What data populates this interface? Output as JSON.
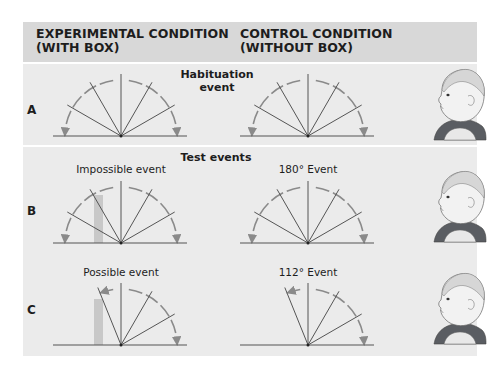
{
  "header": {
    "experimental_title": "EXPERIMENTAL CONDITION\n(WITH BOX)",
    "control_title": "CONTROL CONDITION\n(WITHOUT BOX)"
  },
  "rows": {
    "A": {
      "label": "A",
      "center_title": "Habituation\nevent"
    },
    "B": {
      "label": "B",
      "center_title": "Test events",
      "left_caption": "Impossible event",
      "right_caption": "180° Event"
    },
    "C": {
      "label": "C",
      "left_caption": "Possible event",
      "right_caption": "112° Event"
    }
  },
  "diagrams": [
    {
      "id": "A-left",
      "row": "A",
      "condition": "experimental",
      "screen_rotation_deg": 180,
      "box": false,
      "spoke_angles_deg": [
        30,
        60,
        90,
        120,
        150
      ]
    },
    {
      "id": "A-right",
      "row": "A",
      "condition": "control",
      "screen_rotation_deg": 180,
      "box": false,
      "spoke_angles_deg": [
        30,
        60,
        90,
        120,
        150
      ]
    },
    {
      "id": "B-left",
      "row": "B",
      "condition": "experimental",
      "screen_rotation_deg": 180,
      "box": true,
      "spoke_angles_deg": [
        30,
        60,
        90,
        120,
        150
      ]
    },
    {
      "id": "B-right",
      "row": "B",
      "condition": "control",
      "screen_rotation_deg": 180,
      "box": false,
      "spoke_angles_deg": [
        30,
        60,
        90,
        120,
        150
      ]
    },
    {
      "id": "C-left",
      "row": "C",
      "condition": "experimental",
      "screen_rotation_deg": 112,
      "box": true,
      "spoke_angles_deg": [
        30,
        60,
        90,
        112
      ]
    },
    {
      "id": "C-right",
      "row": "C",
      "condition": "control",
      "screen_rotation_deg": 112,
      "box": false,
      "spoke_angles_deg": [
        30,
        60,
        90,
        112
      ]
    }
  ],
  "colors": {
    "header_band": "#d8d8d8",
    "panel_bg": "#ebebeb",
    "line": "#555555",
    "arc": "#8a8a8a",
    "box": "#c8c8c8",
    "shirt": "#5a5d62",
    "skin": "#f2f2f2"
  }
}
